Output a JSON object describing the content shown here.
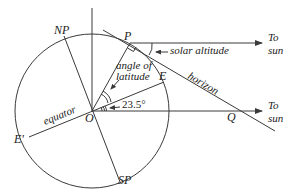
{
  "diagram": {
    "type": "solar-altitude-geometry",
    "labels": {
      "north_pole": "NP",
      "south_pole": "SP",
      "point_p": "P",
      "point_e": "E",
      "point_e_prime": "E'",
      "center": "O",
      "point_q": "Q",
      "equator": "equator",
      "horizon": "horizon",
      "solar_altitude": "solar altitude",
      "angle_of_latitude_line1": "angle of",
      "angle_of_latitude_line2": "latitude",
      "tilt_angle": "23.5°",
      "to_sun_top_1": "To",
      "to_sun_top_2": "sun",
      "to_sun_bottom_1": "To",
      "to_sun_bottom_2": "sun"
    },
    "colors": {
      "line": "#3a3a3a",
      "text": "#222222",
      "background": "#ffffff"
    }
  }
}
